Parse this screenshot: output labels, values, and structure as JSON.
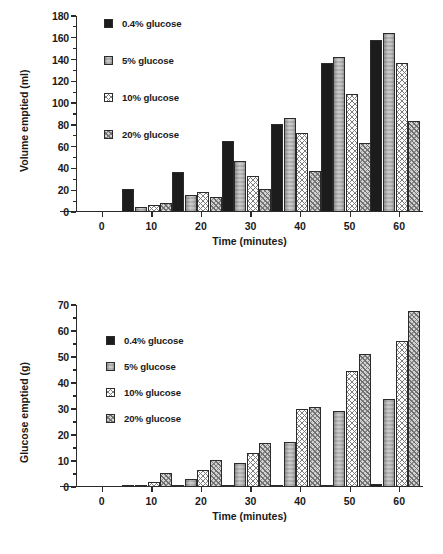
{
  "figure": {
    "series_labels": [
      "0.4% glucose",
      "5% glucose",
      "10% glucose",
      "20% glucose"
    ],
    "series_colors": [
      "#1c1c1c",
      "#c8c8c8",
      "#ffffff",
      "#d3d3d3"
    ]
  },
  "chart_data": [
    {
      "id": "volume-emptied",
      "type": "bar",
      "title": "",
      "xlabel": "Time (minutes)",
      "ylabel": "Volume emptied (ml)",
      "categories": [
        "0",
        "10",
        "20",
        "30",
        "40",
        "50",
        "60"
      ],
      "x": [
        0,
        10,
        20,
        30,
        40,
        50,
        60
      ],
      "ylim": [
        0,
        180
      ],
      "yticks": [
        0,
        20,
        40,
        60,
        80,
        100,
        120,
        140,
        160,
        180
      ],
      "ytick_labels": [
        "0",
        "20",
        "40",
        "60",
        "80",
        "100",
        "120",
        "140",
        "160",
        "180"
      ],
      "minor_ticks": true,
      "grid": false,
      "legend_position": "upper left",
      "series": [
        {
          "name": "0.4% glucose",
          "values": [
            0,
            21,
            37,
            65,
            81,
            137,
            158
          ]
        },
        {
          "name": "5% glucose",
          "values": [
            0,
            5,
            16,
            47,
            86,
            142,
            164
          ]
        },
        {
          "name": "10% glucose",
          "values": [
            0,
            6,
            18,
            33,
            73,
            108,
            137
          ]
        },
        {
          "name": "20% glucose",
          "values": [
            0,
            8,
            14,
            21,
            38,
            63,
            84
          ]
        }
      ]
    },
    {
      "id": "glucose-emptied",
      "type": "bar",
      "title": "",
      "xlabel": "Time (minutes)",
      "ylabel": "Glucose emptied (g)",
      "categories": [
        "0",
        "10",
        "20",
        "30",
        "40",
        "50",
        "60"
      ],
      "x": [
        0,
        10,
        20,
        30,
        40,
        50,
        60
      ],
      "ylim": [
        0,
        70
      ],
      "yticks": [
        0,
        10,
        20,
        30,
        40,
        50,
        60,
        70
      ],
      "ytick_labels": [
        "0",
        "10",
        "20",
        "30",
        "40",
        "50",
        "60",
        "70"
      ],
      "minor_ticks": true,
      "grid": false,
      "legend_position": "upper left",
      "series": [
        {
          "name": "0.4% glucose",
          "values": [
            0,
            0.1,
            0.15,
            0.3,
            0.5,
            0.7,
            1.0
          ]
        },
        {
          "name": "5% glucose",
          "values": [
            0,
            0.8,
            2.9,
            9.4,
            17.4,
            29.3,
            33.8
          ]
        },
        {
          "name": "10% glucose",
          "values": [
            0,
            1.9,
            6.6,
            13.1,
            30.1,
            44.8,
            56.2
          ]
        },
        {
          "name": "20% glucose",
          "values": [
            0,
            5.5,
            10.5,
            16.9,
            30.9,
            51.1,
            67.8
          ]
        }
      ]
    }
  ]
}
